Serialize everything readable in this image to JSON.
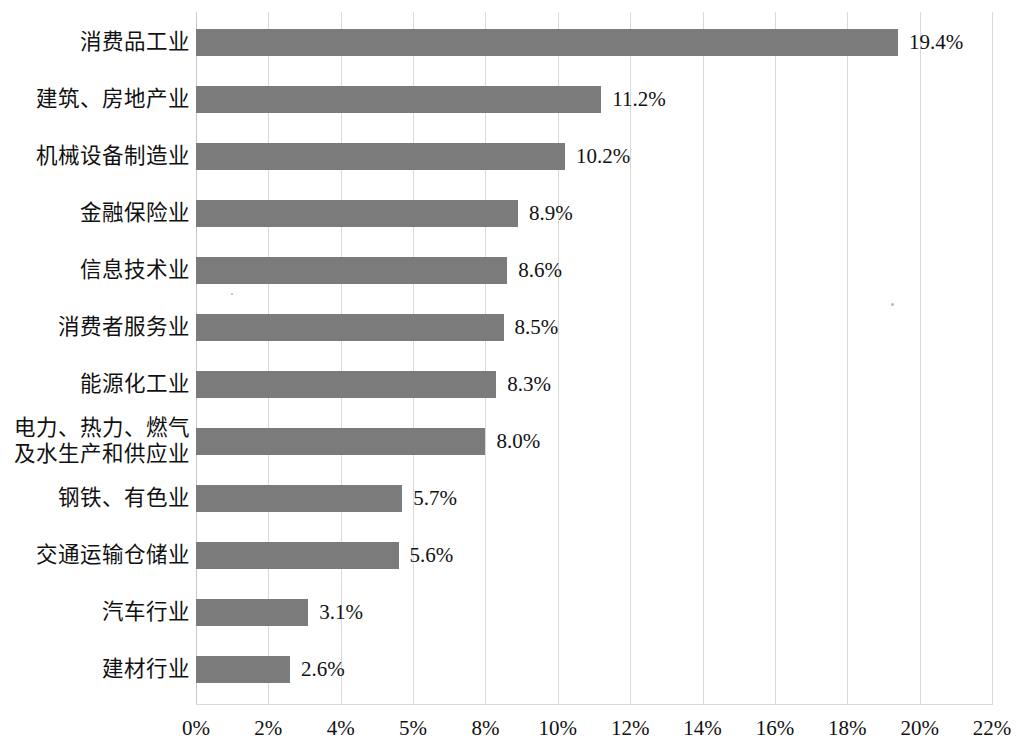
{
  "chart_data": {
    "type": "bar",
    "orientation": "horizontal",
    "title": "",
    "subtitle": "",
    "xlabel": "",
    "ylabel": "",
    "xlim": [
      0,
      22
    ],
    "ylim": null,
    "grid": true,
    "legend": null,
    "legend_position": "none",
    "axis_unit": "%",
    "bar_color": "#7b7b7b",
    "categories": [
      "消费品工业",
      "建筑、房地产业",
      "机械设备制造业",
      "金融保险业",
      "信息技术业",
      "消费者服务业",
      "能源化工业",
      "电力、热力、燃气\n及水生产和供应业",
      "钢铁、有色业",
      "交通运输仓储业",
      "汽车行业",
      "建材行业"
    ],
    "values": [
      19.4,
      11.2,
      10.2,
      8.9,
      8.6,
      8.5,
      8.3,
      8.0,
      5.7,
      5.6,
      3.1,
      2.6
    ],
    "value_labels": [
      "19.4%",
      "11.2%",
      "10.2%",
      "8.9%",
      "8.6%",
      "8.5%",
      "8.3%",
      "8.0%",
      "5.7%",
      "5.6%",
      "3.1%",
      "2.6%"
    ],
    "xticks": [
      0,
      2,
      4,
      6,
      8,
      10,
      12,
      14,
      16,
      18,
      20,
      22
    ],
    "xtick_labels": [
      "0%",
      "2%",
      "4%",
      "5%",
      "8%",
      "10%",
      "12%",
      "14%",
      "16%",
      "18%",
      "20%",
      "22%"
    ]
  }
}
